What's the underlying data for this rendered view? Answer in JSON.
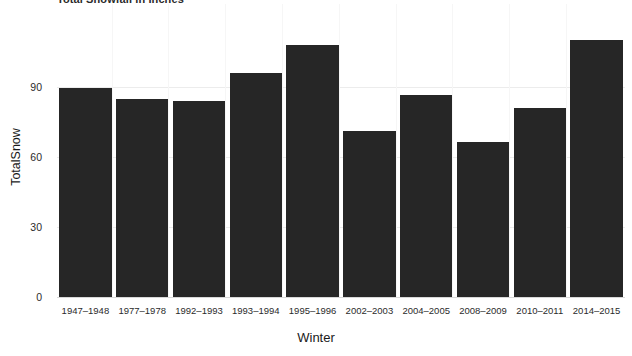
{
  "chart_data": {
    "type": "bar",
    "title": "Total Snowfall in Inches",
    "xlabel": "Winter",
    "ylabel": "TotalSnow",
    "categories": [
      "1947–1948",
      "1977–1978",
      "1992–1993",
      "1993–1994",
      "1995–1996",
      "2002–2003",
      "2004–2005",
      "2008–2009",
      "2010–2011",
      "2014–2015"
    ],
    "values": [
      89.5,
      85,
      84,
      96,
      108,
      71,
      86.5,
      66.5,
      81,
      110
    ],
    "ylim": [
      0,
      113
    ],
    "yticks": [
      0,
      30,
      60,
      90
    ],
    "ytick_labels": [
      "0",
      "30",
      "60",
      "90"
    ],
    "grid": true,
    "legend": null,
    "bar_color": "#262626",
    "axis_color": "#d8d8d8",
    "grid_color": "#f0f0f0",
    "text_color": "#2b2b2b",
    "background": "#ffffff"
  }
}
